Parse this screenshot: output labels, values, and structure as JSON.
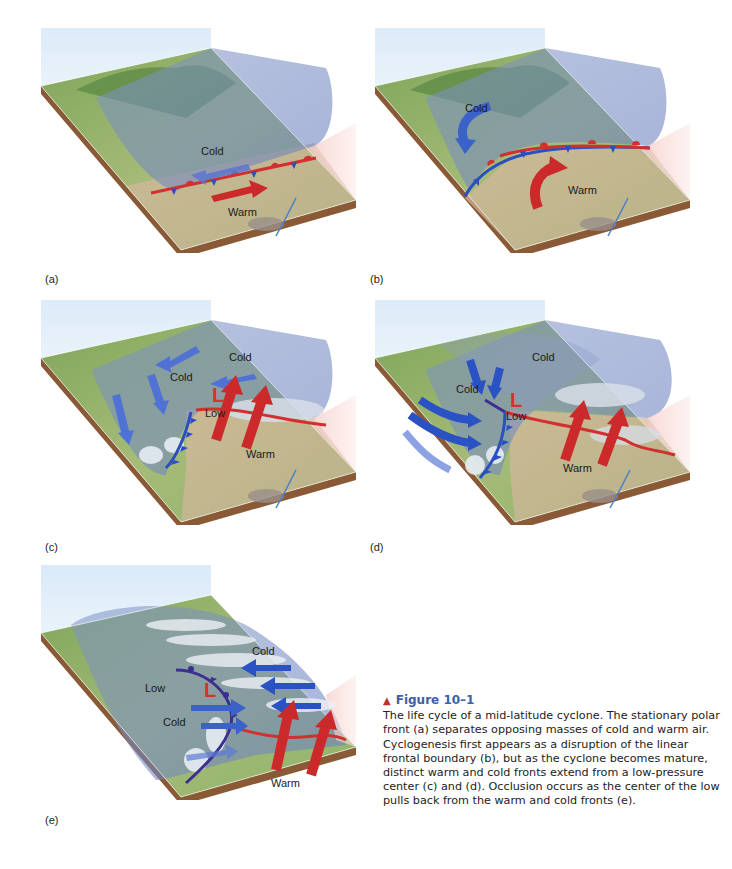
{
  "panels": [
    {
      "id": "a",
      "label": "(a)",
      "texts": {
        "cold": "Cold",
        "warm": "Warm"
      }
    },
    {
      "id": "b",
      "label": "(b)",
      "texts": {
        "cold": "Cold",
        "warm": "Warm"
      }
    },
    {
      "id": "c",
      "label": "(c)",
      "texts": {
        "cold1": "Cold",
        "cold2": "Cold",
        "low_mark": "L",
        "low": "Low",
        "warm": "Warm"
      }
    },
    {
      "id": "d",
      "label": "(d)",
      "texts": {
        "cold1": "Cold",
        "cold2": "Cold",
        "low_mark": "L",
        "low": "Low",
        "warm": "Warm"
      }
    },
    {
      "id": "e",
      "label": "(e)",
      "texts": {
        "cold1": "Cold",
        "cold2": "Cold",
        "low_mark": "L",
        "low": "Low",
        "warm": "Warm"
      }
    }
  ],
  "caption": {
    "marker": "▲",
    "title": "Figure 10–1",
    "body": "The life cycle of a mid-latitude cyclone. The stationary polar front (a) separates opposing masses of cold and warm air. Cyclogenesis first appears as a disruption of the linear frontal boundary (b), but as the cyclone becomes mature, distinct warm and cold fronts extend from a low-pressure center (c) and (d). Occlusion occurs as the center of the low pulls back from the warm and cold fronts (e)."
  },
  "colors": {
    "cold_arrow": "#3a62c9",
    "warm_arrow": "#cc2a2a",
    "cold_front": "#2a4fc0",
    "warm_front": "#d03030",
    "caption_title": "#3c5fa6",
    "caption_marker": "#c0302a"
  }
}
